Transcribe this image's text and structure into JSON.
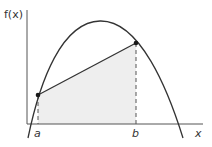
{
  "diagram": {
    "y_axis_label": "f(x)",
    "x_axis_label": "x",
    "point_a_label": "a",
    "point_b_label": "b",
    "colors": {
      "curve": "#333333",
      "axis": "#555555",
      "chord": "#333333",
      "shade": "#eeeeee",
      "point": "#1a1a1a"
    }
  }
}
